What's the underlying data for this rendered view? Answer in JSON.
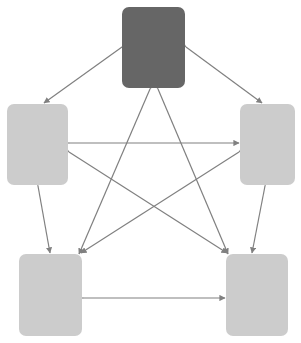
{
  "diagram": {
    "type": "node-link-diagram",
    "canvas": {
      "width": 301,
      "height": 343,
      "background": "#ffffff"
    },
    "layout": "pentagon",
    "edge_style": {
      "color": "#808080",
      "stroke_width": 1.2,
      "arrowhead": "filled-triangle",
      "directionality": "bidirectional"
    },
    "nodes": [
      {
        "id": "top",
        "label": "",
        "shape": "rounded-rectangle",
        "fill": "#666666",
        "x": 122,
        "y": 7,
        "width": 63,
        "height": 81,
        "center_x": 153.5,
        "center_y": 47.5
      },
      {
        "id": "left",
        "label": "",
        "shape": "rounded-rectangle",
        "fill": "#cccccc",
        "x": 7,
        "y": 104,
        "width": 61,
        "height": 81,
        "center_x": 37.5,
        "center_y": 144.5
      },
      {
        "id": "right",
        "label": "",
        "shape": "rounded-rectangle",
        "fill": "#cccccc",
        "x": 240,
        "y": 104,
        "width": 55,
        "height": 81,
        "center_x": 267.5,
        "center_y": 144.5
      },
      {
        "id": "bottom-left",
        "label": "",
        "shape": "rounded-rectangle",
        "fill": "#cccccc",
        "x": 19,
        "y": 254,
        "width": 63,
        "height": 82,
        "center_x": 50.5,
        "center_y": 295
      },
      {
        "id": "bottom-right",
        "label": "",
        "shape": "rounded-rectangle",
        "fill": "#cccccc",
        "x": 226,
        "y": 254,
        "width": 62,
        "height": 82,
        "center_x": 257,
        "center_y": 295
      }
    ],
    "edges": [
      {
        "id": "e-top-left",
        "from": "top",
        "to": "left",
        "kind": "perimeter",
        "x1": 122,
        "y1": 47,
        "x2": 44,
        "y2": 103
      },
      {
        "id": "e-top-right",
        "from": "top",
        "to": "right",
        "kind": "perimeter",
        "x1": 186,
        "y1": 47,
        "x2": 262,
        "y2": 103
      },
      {
        "id": "e-left-bleft",
        "from": "left",
        "to": "bottom-left",
        "kind": "perimeter",
        "x1": 38,
        "y1": 186,
        "x2": 50,
        "y2": 253
      },
      {
        "id": "e-right-bright",
        "from": "right",
        "to": "bottom-right",
        "kind": "perimeter",
        "x1": 265,
        "y1": 186,
        "x2": 252,
        "y2": 253
      },
      {
        "id": "e-bleft-bright",
        "from": "bottom-left",
        "to": "bottom-right",
        "kind": "perimeter",
        "x1": 83,
        "y1": 298,
        "x2": 225,
        "y2": 298
      },
      {
        "id": "e-left-right",
        "from": "left",
        "to": "right",
        "kind": "diagonal",
        "x1": 69,
        "y1": 143,
        "x2": 239,
        "y2": 143
      },
      {
        "id": "e-top-bleft",
        "from": "top",
        "to": "bottom-left",
        "kind": "diagonal",
        "x1": 150,
        "y1": 89,
        "x2": 79,
        "y2": 254
      },
      {
        "id": "e-top-bright",
        "from": "top",
        "to": "bottom-right",
        "kind": "diagonal",
        "x1": 158,
        "y1": 89,
        "x2": 228,
        "y2": 254
      },
      {
        "id": "e-left-bright",
        "from": "left",
        "to": "bottom-right",
        "kind": "diagonal",
        "x1": 69,
        "y1": 152,
        "x2": 227,
        "y2": 253
      },
      {
        "id": "e-right-bleft",
        "from": "right",
        "to": "bottom-left",
        "kind": "diagonal",
        "x1": 239,
        "y1": 152,
        "x2": 81,
        "y2": 253
      }
    ]
  }
}
